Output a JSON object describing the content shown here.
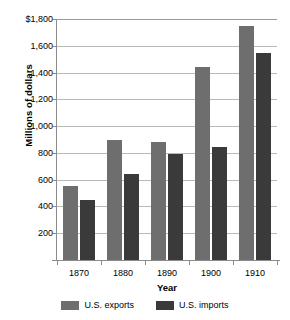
{
  "chart_data": {
    "type": "bar",
    "title": "",
    "xlabel": "Year",
    "ylabel": "Millions of dollars",
    "categories": [
      "1870",
      "1880",
      "1890",
      "1900",
      "1910"
    ],
    "series": [
      {
        "name": "U.S. exports",
        "color": "#6e6e6e",
        "values": [
          550,
          895,
          880,
          1445,
          1745
        ]
      },
      {
        "name": "U.S. imports",
        "color": "#3a3a3a",
        "values": [
          445,
          645,
          795,
          845,
          1545
        ]
      }
    ],
    "ylim": [
      0,
      1800
    ],
    "ytick_values": [
      200,
      400,
      600,
      800,
      1000,
      1200,
      1400,
      1600,
      1800
    ],
    "ytick_labels": [
      "200",
      "400",
      "600",
      "800",
      "1,000",
      "1,200",
      "1,400",
      "1,600",
      "$1,800"
    ],
    "grid": true,
    "legend_position": "bottom"
  },
  "legend": {
    "items": [
      {
        "label": "U.S. exports"
      },
      {
        "label": "U.S. imports"
      }
    ]
  }
}
